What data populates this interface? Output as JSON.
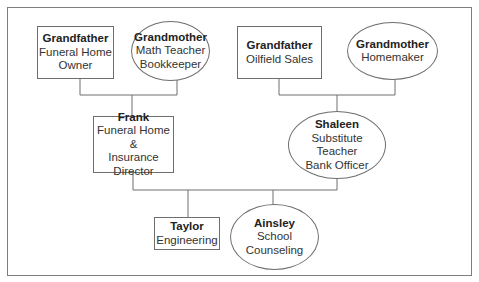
{
  "diagram": {
    "type": "family-tree",
    "top_caption_cut": "...y ... ...g...",
    "nodes": {
      "pgf": {
        "name": "Grandfather",
        "roles": [
          "Funeral Home",
          "Owner"
        ],
        "shape": "rectangle"
      },
      "pgm": {
        "name": "Grandmother",
        "roles": [
          "Math Teacher",
          "Bookkeeper"
        ],
        "shape": "ellipse"
      },
      "mgf": {
        "name": "Grandfather",
        "roles": [
          "Oilfield Sales"
        ],
        "shape": "rectangle"
      },
      "mgm": {
        "name": "Grandmother",
        "roles": [
          "Homemaker"
        ],
        "shape": "ellipse"
      },
      "father": {
        "name": "Frank",
        "roles": [
          "Funeral Home &",
          "Insurance",
          "Director"
        ],
        "shape": "rectangle"
      },
      "mother": {
        "name": "Shaleen",
        "roles": [
          "Substitute",
          "Teacher",
          "Bank Officer"
        ],
        "shape": "ellipse"
      },
      "son": {
        "name": "Taylor",
        "roles": [
          "Engineering"
        ],
        "shape": "rectangle"
      },
      "daughter": {
        "name": "Ainsley",
        "roles": [
          "School",
          "Counseling"
        ],
        "shape": "ellipse"
      }
    },
    "edges": [
      {
        "from": [
          "pgf",
          "pgm"
        ],
        "to": "father"
      },
      {
        "from": [
          "mgf",
          "mgm"
        ],
        "to": "mother"
      },
      {
        "from": [
          "father",
          "mother"
        ],
        "to": [
          "son",
          "daughter"
        ]
      }
    ],
    "colors": {
      "line": "#6e6e6e",
      "frame": "#7d7d7d",
      "background": "#ffffff",
      "text": "#2a2a2a"
    }
  }
}
